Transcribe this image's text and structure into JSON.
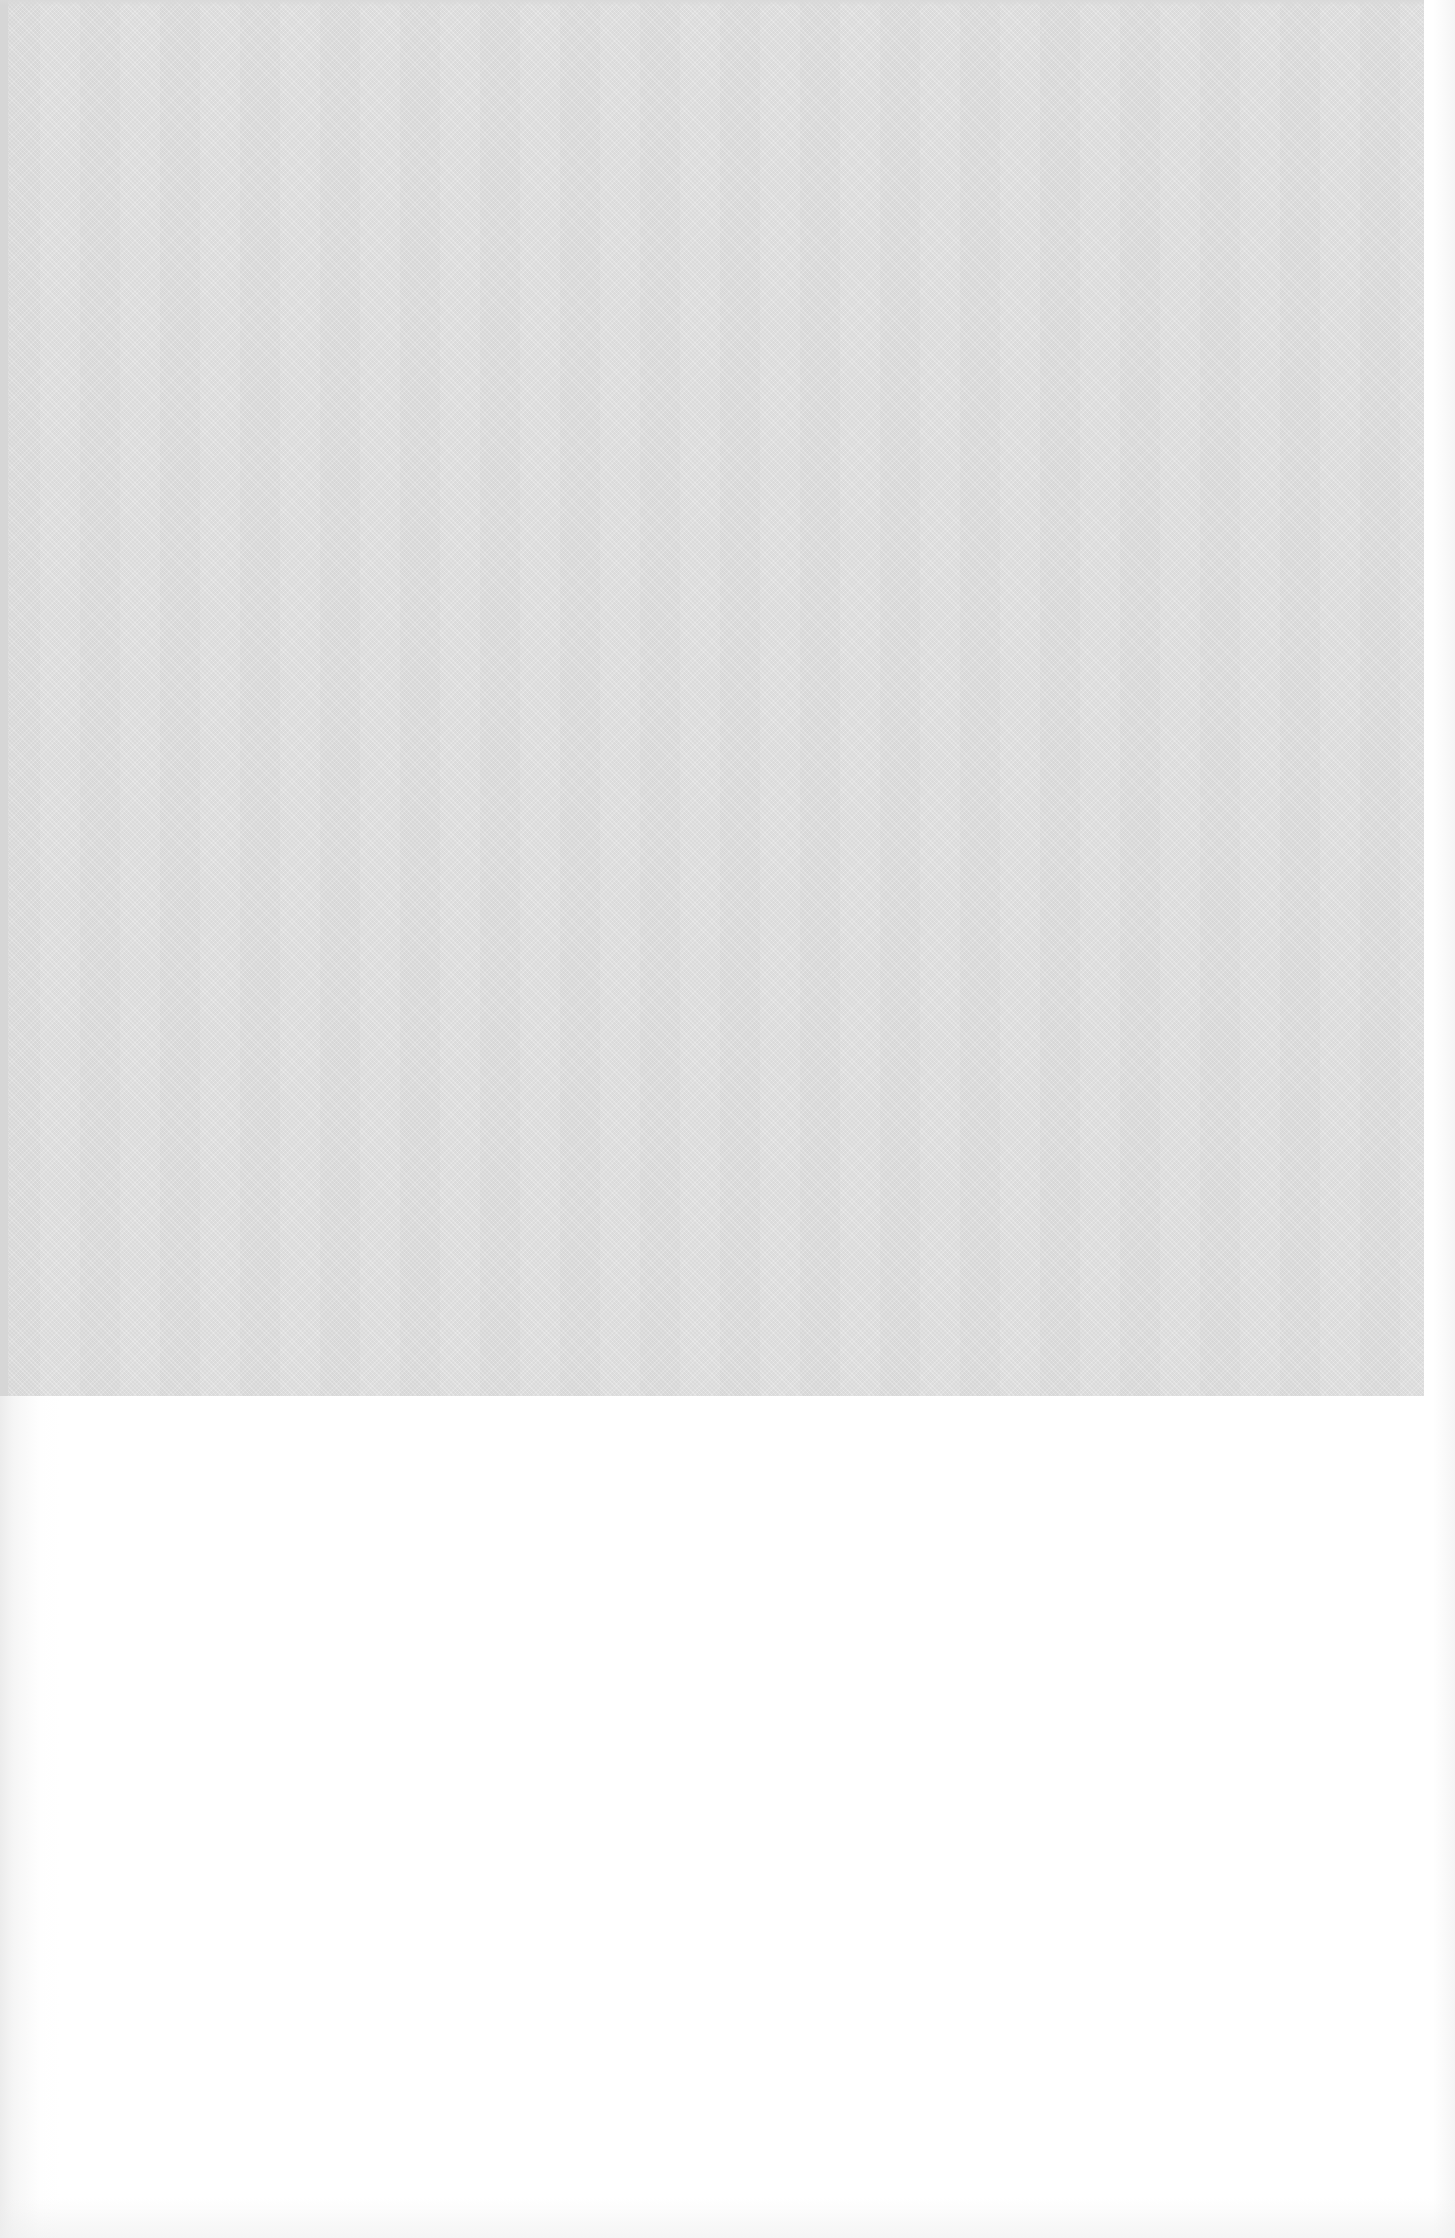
{
  "page": {
    "type": "scanned-book-page",
    "texts": []
  },
  "plate": {
    "description": "textured-gray-plate",
    "fill_color": "#e3e3e3",
    "edge_color": "#d6d6d6"
  },
  "colors": {
    "paper": "#ffffff",
    "plate": "#e3e3e3"
  }
}
